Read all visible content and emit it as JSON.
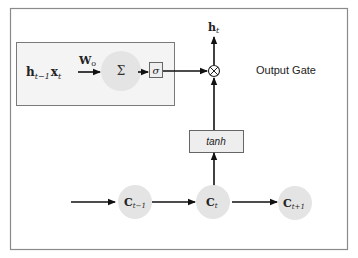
{
  "title": "Output Gate",
  "colors": {
    "frame_border": "#8a8a8a",
    "inner_box_fill": "#f4f4f4",
    "inner_box_border": "#7a7a7a",
    "node_fill": "#e4e4e4",
    "line": "#111111",
    "text": "#222222"
  },
  "inputs": {
    "h_main": "h",
    "h_sub": "t−1",
    "x_main": "x",
    "x_sub": "t"
  },
  "weight": {
    "main": "W",
    "sub": "o"
  },
  "sum_node": {
    "symbol": "Σ"
  },
  "sigmoid_box": {
    "symbol": "σ"
  },
  "multiply_node": {
    "symbol": "⊗"
  },
  "output": {
    "main": "h",
    "sub": "t"
  },
  "tanh_box": {
    "label": "tanh"
  },
  "cell_states": [
    {
      "main": "C",
      "sub": "t−1"
    },
    {
      "main": "C",
      "sub": "t"
    },
    {
      "main": "C",
      "sub": "t+1"
    }
  ]
}
